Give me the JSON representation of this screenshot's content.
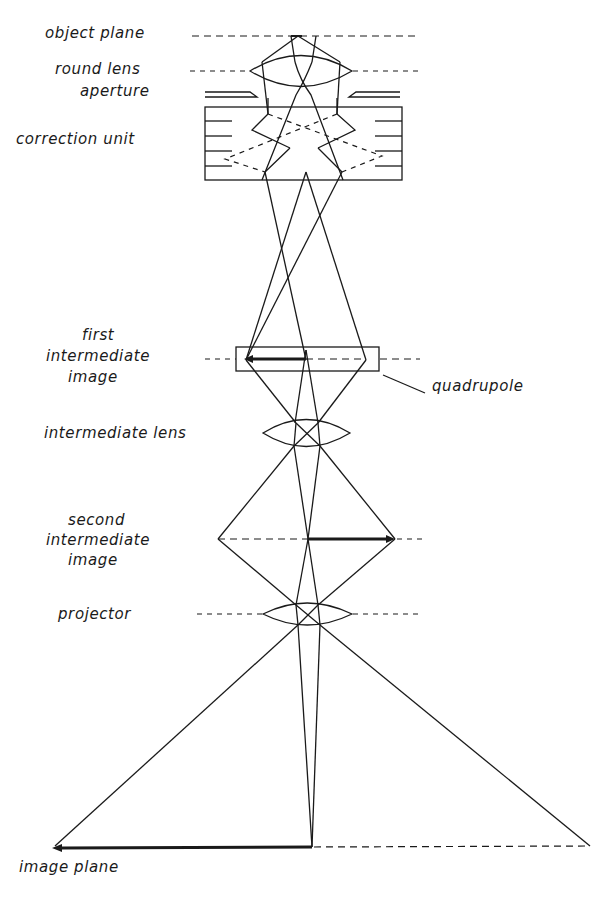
{
  "diagram": {
    "labels": {
      "object_plane": "object plane",
      "round_lens": "round lens",
      "aperture": "aperture",
      "correction_unit": "correction unit",
      "first_intermediate_image_1": "first",
      "first_intermediate_image_2": "intermediate",
      "first_intermediate_image_3": "image",
      "quadrupole": "quadrupole",
      "intermediate_lens": "intermediate lens",
      "second_intermediate_image_1": "second",
      "second_intermediate_image_2": "intermediate",
      "second_intermediate_image_3": "image",
      "projector": "projector",
      "image_plane": "image plane"
    },
    "colors": {
      "ink": "#1a1a1a",
      "background": "#ffffff"
    }
  }
}
